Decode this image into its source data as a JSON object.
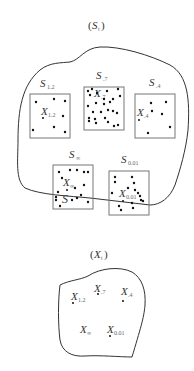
{
  "top_panel": {
    "title_open": "(",
    "title_var": "S",
    "title_sub": "t",
    "title_close": ")",
    "sets": [
      {
        "var": "S",
        "sub": "1.2",
        "point_var": "X",
        "point_sub": "1.2"
      },
      {
        "var": "S",
        "sub": ".7",
        "point_var": "X",
        "point_sub": ".7"
      },
      {
        "var": "S",
        "sub": ".4",
        "point_var": "X",
        "point_sub": ".4"
      },
      {
        "var": "S",
        "sub": "∞",
        "point_var": "X",
        "point_sub": "∞",
        "extra_label": "S"
      },
      {
        "var": "S",
        "sub": "0.01",
        "point_var": "X",
        "point_sub": "0.01"
      }
    ]
  },
  "bottom_panel": {
    "title_open": "(",
    "title_var": "X",
    "title_sub": "t",
    "title_close": ")",
    "points": [
      {
        "var": "X",
        "sub": "1.2"
      },
      {
        "var": "X",
        "sub": ".7"
      },
      {
        "var": "X",
        "sub": ".4"
      },
      {
        "var": "X",
        "sub": "∞"
      },
      {
        "var": "X",
        "sub": "0.01"
      }
    ]
  }
}
